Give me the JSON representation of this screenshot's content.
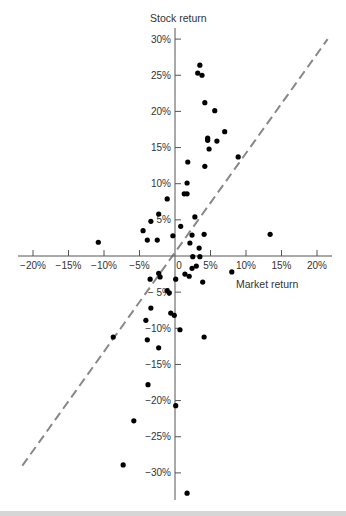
{
  "chart_data": {
    "type": "scatter",
    "title": "",
    "xlabel": "Market return",
    "ylabel": "Stock return",
    "xlim": [
      -22,
      22
    ],
    "ylim": [
      -34,
      31
    ],
    "x_ticks": [
      -20,
      -15,
      -10,
      -5,
      0,
      5,
      10,
      15,
      20
    ],
    "x_tick_labels": [
      "−20%",
      "−15%",
      "−10%",
      "−5%",
      "0",
      "5%",
      "10%",
      "15%",
      "20%"
    ],
    "y_ticks": [
      30,
      25,
      20,
      15,
      10,
      5,
      -5,
      -10,
      -15,
      -20,
      -25,
      -30
    ],
    "y_tick_labels": [
      "30%",
      "25%",
      "20%",
      "15%",
      "10%",
      "5%",
      "− 5%",
      "−10%",
      "−15%",
      "−20%",
      "−25%",
      "−30%"
    ],
    "grid": false,
    "reference_line": {
      "style": "dashed",
      "color": "#888888",
      "from": [
        -21.5,
        -29
      ],
      "to": [
        21.5,
        30
      ],
      "description": "45-degree line (beta = 1)"
    },
    "series": [
      {
        "name": "Monthly returns",
        "color": "#000000",
        "points": [
          [
            3.5,
            26.4
          ],
          [
            3.2,
            25.3
          ],
          [
            3.8,
            25.0
          ],
          [
            4.2,
            21.2
          ],
          [
            5.6,
            20.1
          ],
          [
            4.6,
            16.3
          ],
          [
            4.6,
            16.0
          ],
          [
            5.9,
            15.9
          ],
          [
            7.0,
            17.2
          ],
          [
            4.8,
            14.8
          ],
          [
            1.8,
            13.0
          ],
          [
            4.2,
            12.4
          ],
          [
            8.9,
            13.7
          ],
          [
            1.7,
            10.1
          ],
          [
            1.3,
            8.6
          ],
          [
            1.7,
            8.6
          ],
          [
            -1.1,
            7.9
          ],
          [
            -2.3,
            5.8
          ],
          [
            -3.4,
            4.8
          ],
          [
            -4.5,
            3.5
          ],
          [
            -3.9,
            2.2
          ],
          [
            -2.5,
            2.2
          ],
          [
            2.8,
            5.4
          ],
          [
            0.8,
            4.1
          ],
          [
            -0.3,
            2.8
          ],
          [
            2.4,
            2.9
          ],
          [
            4.1,
            3.0
          ],
          [
            2.1,
            1.8
          ],
          [
            3.4,
            1.1
          ],
          [
            -10.8,
            1.9
          ],
          [
            13.4,
            3.0
          ],
          [
            2.5,
            -0.1
          ],
          [
            3.5,
            -0.1
          ],
          [
            2.4,
            -1.7
          ],
          [
            3.0,
            -1.4
          ],
          [
            1.4,
            -2.5
          ],
          [
            2.0,
            -2.8
          ],
          [
            0.1,
            -3.2
          ],
          [
            3.9,
            -3.6
          ],
          [
            8.0,
            -2.2
          ],
          [
            -3.5,
            -3.2
          ],
          [
            -2.3,
            -2.4
          ],
          [
            -2.1,
            -2.9
          ],
          [
            -1.1,
            -4.8
          ],
          [
            -0.8,
            -5.1
          ],
          [
            -3.4,
            -7.2
          ],
          [
            -0.6,
            -7.9
          ],
          [
            -0.1,
            -8.2
          ],
          [
            -4.1,
            -8.9
          ],
          [
            -8.7,
            -11.2
          ],
          [
            -3.9,
            -11.6
          ],
          [
            -2.3,
            -12.7
          ],
          [
            0.7,
            -10.2
          ],
          [
            4.1,
            -11.2
          ],
          [
            -3.8,
            -17.8
          ],
          [
            0.1,
            -20.7
          ],
          [
            -5.8,
            -22.8
          ],
          [
            -7.3,
            -28.9
          ],
          [
            1.7,
            -32.8
          ]
        ]
      }
    ]
  }
}
